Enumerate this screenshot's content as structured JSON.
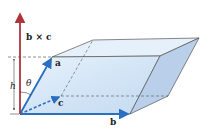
{
  "diagram": {
    "labels": {
      "cross": "b × c",
      "a": "a",
      "b": "b",
      "c": "c",
      "h": "h",
      "theta": "θ"
    },
    "colors": {
      "cross_vector": "#b0343c",
      "edge_vectors": "#2a6fc0",
      "face_light": "#d8e8f7",
      "face_side": "#b9cfea",
      "edges": "#555555"
    }
  }
}
